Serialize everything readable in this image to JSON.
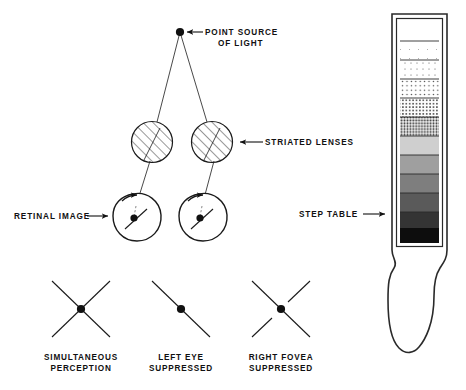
{
  "figure": {
    "title_hidden_caption": "Figure",
    "labels": {
      "point_source_line1": "POINT SOURCE",
      "point_source_line2": "OF LIGHT",
      "striated_lenses": "STRIATED LENSES",
      "retinal_image": "RETINAL IMAGE",
      "step_table": "STEP TABLE"
    },
    "panels": [
      {
        "id": "simultaneous-perception",
        "line1": "SIMULTANEOUS",
        "line2": "PERCEPTION",
        "pattern": "x-cross"
      },
      {
        "id": "left-eye-suppressed",
        "line1": "LEFT EYE",
        "line2": "SUPPRESSED",
        "pattern": "single-line"
      },
      {
        "id": "right-fovea-suppressed",
        "line1": "RIGHT FOVEA",
        "line2": "SUPPRESSED",
        "pattern": "x-cross-gap"
      }
    ],
    "step_table": {
      "steps": [
        "#ffffff",
        "#fbfbfb",
        "#f2f2f2",
        "#e4e4e4",
        "#d2d2d2",
        "#bdbdbd",
        "#9d9d9d",
        "#7a7a7a",
        "#575757",
        "#3a3a3a",
        "#1f1f1f",
        "#0a0a0a"
      ],
      "step_count": 12
    },
    "colors": {
      "ink": "#111111",
      "stroke": "#1a1a1a",
      "paper": "#ffffff",
      "frame": "#2a2a2a"
    }
  },
  "footnote": {
    "text": ""
  }
}
